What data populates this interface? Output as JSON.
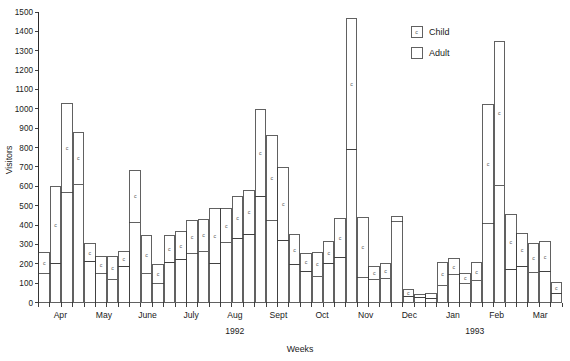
{
  "chart_data": {
    "type": "bar",
    "subtype": "stacked",
    "title": "",
    "xlabel": "Weeks",
    "ylabel": "Visitors",
    "ylim": [
      0,
      1500
    ],
    "ytick_step": 100,
    "yticks": [
      0,
      100,
      200,
      300,
      400,
      500,
      600,
      700,
      800,
      900,
      1000,
      1100,
      1200,
      1300,
      1400,
      1500
    ],
    "grid": false,
    "legend_position": "top-right",
    "legend": [
      {
        "name": "Child",
        "marker": "c",
        "swatch": "outlined-box-with-c"
      },
      {
        "name": "Adult",
        "marker": "",
        "swatch": "outlined-box"
      }
    ],
    "series": [
      {
        "name": "Child",
        "values": [
          150,
          200,
          570,
          610,
          210,
          150,
          120,
          185,
          415,
          150,
          100,
          205,
          220,
          255,
          265,
          200,
          310,
          330,
          350,
          545,
          425,
          320,
          195,
          160,
          135,
          200,
          230,
          790,
          130,
          120,
          125,
          420,
          30,
          25,
          20,
          90,
          145,
          100,
          115,
          410,
          605,
          170,
          185,
          155,
          160,
          45
        ]
      },
      {
        "name": "Adult",
        "values": [
          110,
          400,
          460,
          270,
          95,
          90,
          115,
          80,
          265,
          195,
          95,
          140,
          145,
          170,
          165,
          285,
          175,
          215,
          230,
          450,
          435,
          375,
          155,
          95,
          125,
          115,
          205,
          675,
          310,
          65,
          75,
          25,
          35,
          15,
          25,
          115,
          80,
          50,
          90,
          610,
          745,
          285,
          170,
          150,
          155,
          60
        ]
      }
    ],
    "totals": [
      260,
      600,
      1030,
      880,
      305,
      240,
      235,
      265,
      680,
      345,
      195,
      345,
      365,
      425,
      430,
      485,
      485,
      545,
      580,
      995,
      860,
      695,
      350,
      255,
      260,
      315,
      435,
      1465,
      440,
      185,
      200,
      445,
      65,
      40,
      45,
      205,
      225,
      150,
      205,
      1020,
      1350,
      455,
      355,
      305,
      315,
      105
    ],
    "months": [
      {
        "label": "Apr",
        "year": "1992"
      },
      {
        "label": "May",
        "year": "1992"
      },
      {
        "label": "June",
        "year": "1992"
      },
      {
        "label": "July",
        "year": "1992"
      },
      {
        "label": "Aug",
        "year": "1992"
      },
      {
        "label": "Sept",
        "year": "1992"
      },
      {
        "label": "Oct",
        "year": "1992"
      },
      {
        "label": "Nov",
        "year": "1992"
      },
      {
        "label": "Dec",
        "year": "1992"
      },
      {
        "label": "Jan",
        "year": "1993"
      },
      {
        "label": "Feb",
        "year": "1993"
      },
      {
        "label": "Mar",
        "year": "1993"
      }
    ],
    "year_groups": [
      {
        "label": "1992"
      },
      {
        "label": "1993"
      }
    ],
    "cell_marker": "c"
  }
}
